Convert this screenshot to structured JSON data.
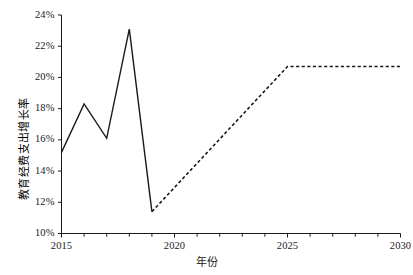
{
  "chart_data": {
    "type": "line",
    "title": "",
    "xlabel": "年份",
    "ylabel": "教育经费支出增长率",
    "xlim": [
      2015,
      2030
    ],
    "ylim": [
      10,
      24
    ],
    "grid": false,
    "legend": "none",
    "x_tick_labels": [
      "2015",
      "2020",
      "2025",
      "2030"
    ],
    "x_tick_values": [
      2015,
      2020,
      2025,
      2030
    ],
    "x_minor_ticks": [
      2016,
      2017,
      2018,
      2019,
      2021,
      2022,
      2023,
      2024,
      2026,
      2027,
      2028,
      2029
    ],
    "y_tick_labels": [
      "10%",
      "12%",
      "14%",
      "16%",
      "18%",
      "20%",
      "22%",
      "24%"
    ],
    "y_tick_values": [
      10,
      12,
      14,
      16,
      18,
      20,
      22,
      24
    ],
    "y_unit": "%",
    "series": [
      {
        "name": "历史值",
        "style": "solid",
        "color": "#1a1a1a",
        "x": [
          2015,
          2016,
          2017,
          2018,
          2019
        ],
        "values": [
          15.2,
          18.3,
          16.1,
          23.1,
          11.4
        ]
      },
      {
        "name": "预测值",
        "style": "dashed",
        "color": "#1a1a1a",
        "x": [
          2019,
          2025,
          2030
        ],
        "values": [
          11.4,
          20.7,
          20.7
        ]
      }
    ]
  },
  "axis": {
    "y_label_text": "教育经费支出增长率",
    "x_label_text": "年份"
  }
}
